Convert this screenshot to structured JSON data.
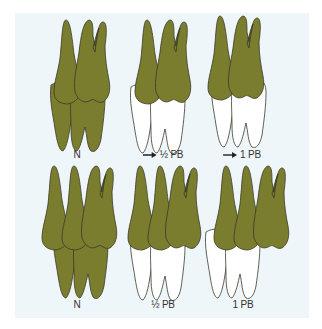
{
  "figure": {
    "colors": {
      "panel_background": "#eef6f9",
      "upper_tooth_fill": "#7b7d2e",
      "lower_tooth_fill_normal": "#7b7d2e",
      "lower_tooth_fill_shifted": "#ffffff",
      "outline": "#3a3a2a"
    },
    "rows": [
      {
        "panels": [
          {
            "label": "N",
            "arrow": false,
            "shifted": false
          },
          {
            "label": "½ PB",
            "arrow": true,
            "arrow_icon": "right-arrow-icon",
            "shifted": true
          },
          {
            "label": "1 PB",
            "arrow": true,
            "arrow_icon": "right-arrow-icon",
            "shifted": true
          }
        ]
      },
      {
        "panels": [
          {
            "label": "N",
            "arrow": false,
            "shifted": false
          },
          {
            "label": "½ PB",
            "arrow": false,
            "shifted": true
          },
          {
            "label": "1 PB",
            "arrow": false,
            "shifted": true
          }
        ]
      }
    ]
  }
}
